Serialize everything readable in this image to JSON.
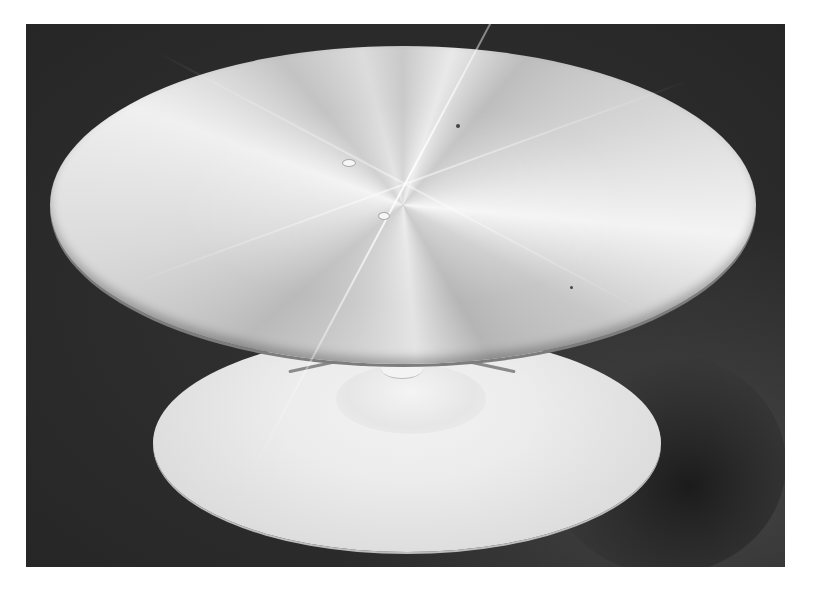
{
  "image": {
    "subject": "Metal turntable disc on pedestal base",
    "style": "black-and-white photograph",
    "colors": {
      "page_background": "#ffffff",
      "backdrop": "#2f2f2f",
      "disc_metal": "#cfcfcf",
      "base": "#e6e6e6"
    },
    "frame": {
      "x": 26,
      "y": 24,
      "width": 759,
      "height": 543
    },
    "objects": [
      {
        "name": "top-disc",
        "shape": "ellipse",
        "cx": 403,
        "cy": 181,
        "w": 706,
        "h": 318,
        "texture": "radial brushed aluminium"
      },
      {
        "name": "base-disc",
        "shape": "ellipse",
        "cx": 407,
        "cy": 443,
        "w": 508,
        "h": 218,
        "texture": "matte white"
      },
      {
        "name": "center-stem",
        "shape": "cylinder",
        "cx": 402,
        "cy": 365
      }
    ]
  }
}
